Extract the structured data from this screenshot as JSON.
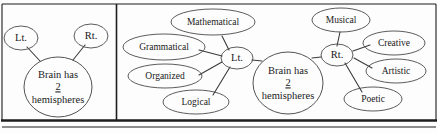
{
  "figure": {
    "kind": "concept-map-diagram",
    "panels": [
      {
        "id": "left-panel",
        "name": "simple-brain-map",
        "center_node": {
          "label_lines": [
            "Brain has",
            "2",
            "hemispheres"
          ],
          "underlined_line": "2"
        },
        "branches": [
          {
            "label": "Lt."
          },
          {
            "label": "Rt."
          }
        ]
      },
      {
        "id": "right-panel",
        "name": "expanded-brain-map",
        "center_node": {
          "label_lines": [
            "Brain has",
            "2",
            "hemispheres"
          ],
          "underlined_line": "2"
        },
        "branches": [
          {
            "label": "Lt.",
            "children": [
              "Mathematical",
              "Grammatical",
              "Organized",
              "Logical"
            ]
          },
          {
            "label": "Rt.",
            "children": [
              "Musical",
              "Creative",
              "Artistic",
              "Poetic"
            ]
          }
        ]
      }
    ],
    "colors": {
      "stroke": "#4a4a4a",
      "edge": "#3b3b3b",
      "frame": "#1d1d1d",
      "text": "#1a1a1a",
      "background": "#fdfdfd"
    }
  }
}
